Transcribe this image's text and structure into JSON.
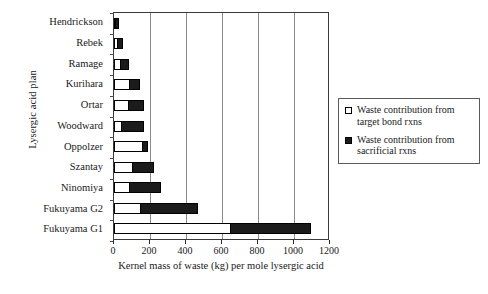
{
  "chart_data": {
    "type": "bar",
    "orientation": "horizontal",
    "stacked": true,
    "title": "",
    "xlabel": "Kernel mass of waste (kg) per mole lysergic acid",
    "ylabel": "Lysergic acid plan",
    "xlim": [
      0,
      1200
    ],
    "xticks": [
      0,
      200,
      400,
      600,
      800,
      1000,
      1200
    ],
    "xtick_labels": [
      "0",
      "200",
      "400",
      "600",
      "800",
      "1000",
      "1200"
    ],
    "grid": "vertical",
    "legend_position": "right",
    "categories": [
      "Hendrickson",
      "Rebek",
      "Ramage",
      "Kurihara",
      "Ortar",
      "Woodward",
      "Oppolzer",
      "Szantay",
      "Ninomiya",
      "Fukuyama G2",
      "Fukuyama G1"
    ],
    "series": [
      {
        "name": "Waste contribution from target bond rxns",
        "color": "#ffffff",
        "values": [
          8,
          20,
          40,
          90,
          85,
          45,
          160,
          105,
          90,
          150,
          650
        ]
      },
      {
        "name": "Waste contribution from sacrificial rxns",
        "color": "#1b1b1b",
        "values": [
          22,
          35,
          50,
          60,
          85,
          130,
          35,
          125,
          175,
          320,
          450
        ]
      }
    ],
    "totals": [
      30,
      55,
      90,
      150,
      170,
      175,
      195,
      230,
      265,
      470,
      1100
    ]
  },
  "legend": {
    "entries": [
      {
        "swatch": "hollow",
        "line1": "Waste contribution from",
        "line2": "target bond rxns"
      },
      {
        "swatch": "filled",
        "line1": "Waste contribution from",
        "line2": "sacrificial rxns"
      }
    ]
  }
}
